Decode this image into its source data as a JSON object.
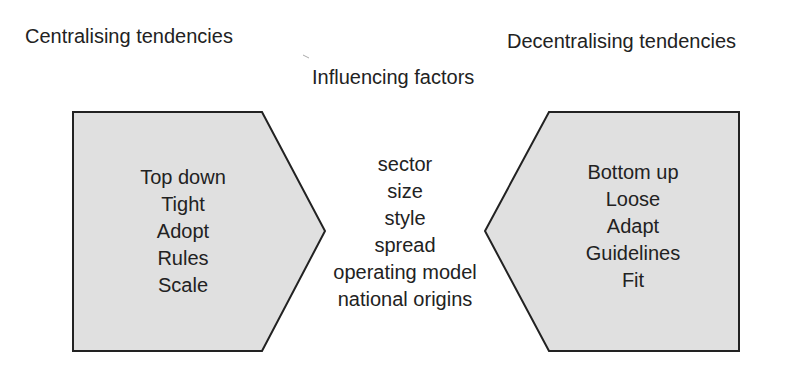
{
  "headings": {
    "left": "Centralising tendencies",
    "right": "Decentralising tendencies",
    "center": "Influencing factors"
  },
  "left_shape": {
    "items": [
      "Top down",
      "Tight",
      "Adopt",
      "Rules",
      "Scale"
    ],
    "fill": "#e0e0e0",
    "stroke": "#222222"
  },
  "right_shape": {
    "items": [
      "Bottom up",
      "Loose",
      "Adapt",
      "Guidelines",
      "Fit"
    ],
    "fill": "#e0e0e0",
    "stroke": "#222222"
  },
  "factors": {
    "items": [
      "sector",
      "size",
      "style",
      "spread",
      "operating model",
      "national origins"
    ]
  }
}
